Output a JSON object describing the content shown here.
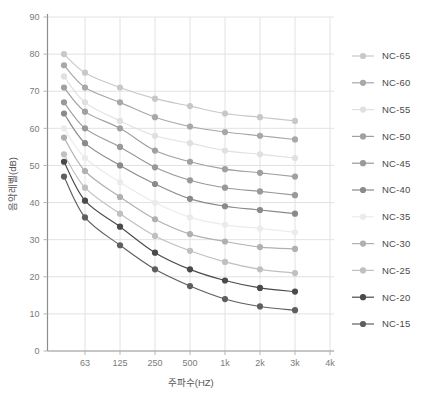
{
  "chart_data": {
    "type": "line",
    "title": "",
    "xlabel": "주파수(HZ)",
    "ylabel": "음악레벨(dB)",
    "x_tick_labels": [
      "63",
      "125",
      "250",
      "500",
      "1k",
      "2k",
      "3k",
      "4k"
    ],
    "y_tick_labels": [
      "0",
      "10",
      "20",
      "30",
      "40",
      "50",
      "60",
      "70",
      "80",
      "90"
    ],
    "ylim": [
      0,
      90
    ],
    "grid": true,
    "legend_position": "right",
    "x_positions_hz": [
      31.5,
      63,
      125,
      250,
      500,
      1000,
      2000,
      3000
    ],
    "series": [
      {
        "name": "NC-65",
        "color": "#c8c8c8",
        "values": [
          80.0,
          75.0,
          71.0,
          68.0,
          66.0,
          64.0,
          63.0,
          62.0
        ]
      },
      {
        "name": "NC-60",
        "color": "#a8a8a8",
        "values": [
          77.0,
          71.0,
          67.0,
          63.0,
          60.5,
          59.0,
          58.0,
          57.0
        ]
      },
      {
        "name": "NC-55",
        "color": "#e0e0e0",
        "values": [
          74.0,
          67.0,
          62.0,
          58.0,
          56.0,
          54.0,
          53.0,
          52.0
        ]
      },
      {
        "name": "NC-50",
        "color": "#a0a0a0",
        "values": [
          71.0,
          64.5,
          60.0,
          54.0,
          51.0,
          49.0,
          48.0,
          47.0
        ]
      },
      {
        "name": "NC-45",
        "color": "#999999",
        "values": [
          67.0,
          60.0,
          55.0,
          49.5,
          46.0,
          44.0,
          43.0,
          42.0
        ]
      },
      {
        "name": "NC-40",
        "color": "#8a8a8a",
        "values": [
          64.0,
          56.0,
          50.0,
          45.0,
          41.0,
          39.0,
          38.0,
          37.0
        ]
      },
      {
        "name": "NC-35",
        "color": "#ebebeb",
        "values": [
          60.0,
          52.0,
          45.5,
          40.0,
          36.0,
          34.0,
          33.0,
          32.0
        ]
      },
      {
        "name": "NC-30",
        "color": "#b0b0b0",
        "values": [
          57.5,
          48.5,
          41.5,
          35.5,
          31.5,
          29.5,
          28.0,
          27.5
        ]
      },
      {
        "name": "NC-25",
        "color": "#c0c0c0",
        "values": [
          53.0,
          44.0,
          37.0,
          31.0,
          27.0,
          24.0,
          22.0,
          21.0
        ]
      },
      {
        "name": "NC-20",
        "color": "#4a4a4a",
        "values": [
          51.0,
          40.5,
          33.5,
          26.5,
          22.0,
          19.0,
          17.0,
          16.0
        ]
      },
      {
        "name": "NC-15",
        "color": "#5f5f5f",
        "values": [
          47.0,
          36.0,
          28.5,
          22.0,
          17.5,
          14.0,
          12.0,
          11.0
        ]
      }
    ]
  },
  "legend": {
    "entries": [
      {
        "label": "NC-65"
      },
      {
        "label": "NC-60"
      },
      {
        "label": "NC-55"
      },
      {
        "label": "NC-50"
      },
      {
        "label": "NC-45"
      },
      {
        "label": "NC-40"
      },
      {
        "label": "NC-35"
      },
      {
        "label": "NC-30"
      },
      {
        "label": "NC-25"
      },
      {
        "label": "NC-20"
      },
      {
        "label": "NC-15"
      }
    ]
  },
  "colors": {
    "background": "#ffffff",
    "grid": "#e2e2e2",
    "axis": "#8d8d8d",
    "tick_text": "#7a7a7a",
    "title_text": "#555555"
  }
}
